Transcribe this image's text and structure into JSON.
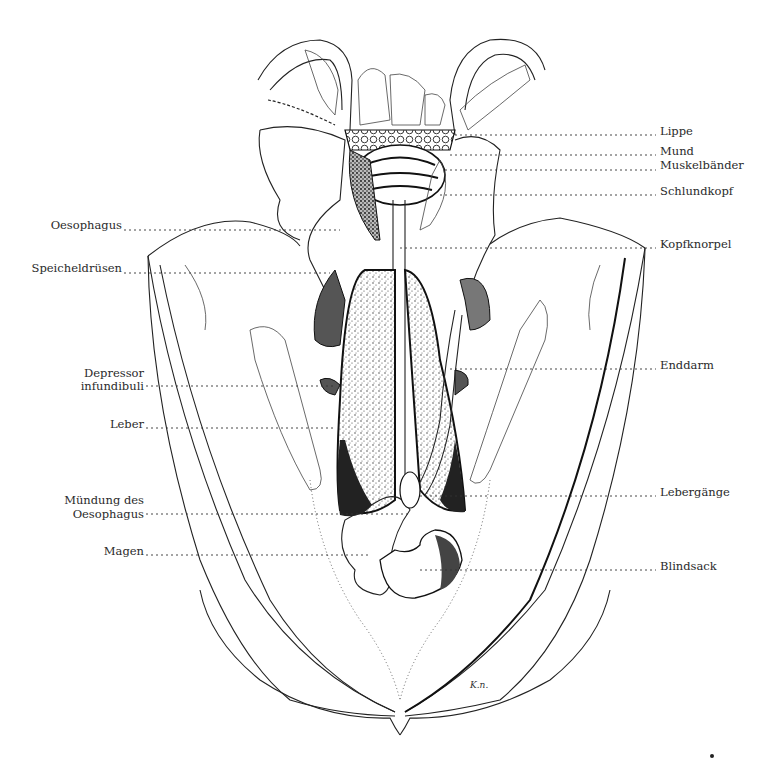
{
  "figure": {
    "signature": "K.n.",
    "labels_left": [
      {
        "id": "oesophagus",
        "text": "Oesophagus",
        "x": 122,
        "y": 226,
        "line_to": 340
      },
      {
        "id": "speicheldruesen",
        "text": "Speicheldrüsen",
        "x": 122,
        "y": 270,
        "line_to": 330
      },
      {
        "id": "depressor-infundibuli",
        "lines": [
          "Depressor",
          "infundibuli"
        ],
        "x": 144,
        "y": 372,
        "line_y": 386,
        "line_to": 335
      },
      {
        "id": "leber",
        "text": "Leber",
        "x": 144,
        "y": 424,
        "line_to": 335
      },
      {
        "id": "muendung-des-oesophagus",
        "lines": [
          "Mündung des",
          "Oesophagus"
        ],
        "x": 144,
        "y": 498,
        "line_y": 513,
        "line_to": 410
      },
      {
        "id": "magen",
        "text": "Magen",
        "x": 144,
        "y": 551,
        "line_to": 370
      }
    ],
    "labels_right": [
      {
        "id": "lippe",
        "text": "Lippe",
        "x": 660,
        "y": 131,
        "line_from": 455
      },
      {
        "id": "mund",
        "text": "Mund",
        "x": 660,
        "y": 152,
        "line_from": 450
      },
      {
        "id": "muskelbaender",
        "text": "Muskelbänder",
        "x": 660,
        "y": 166,
        "line_from": 445
      },
      {
        "id": "schlundkopf",
        "text": "Schlundkopf",
        "x": 660,
        "y": 191,
        "line_from": 440
      },
      {
        "id": "kopfknorpel",
        "text": "Kopfknorpel",
        "x": 660,
        "y": 244,
        "line_from": 400
      },
      {
        "id": "enddarm",
        "text": "Enddarm",
        "x": 660,
        "y": 366,
        "line_from": 450
      },
      {
        "id": "lebergaenge",
        "text": "Lebergänge",
        "x": 660,
        "y": 493,
        "line_from": 420
      },
      {
        "id": "blindsack",
        "text": "Blindsack",
        "x": 660,
        "y": 567,
        "line_from": 420
      }
    ]
  }
}
